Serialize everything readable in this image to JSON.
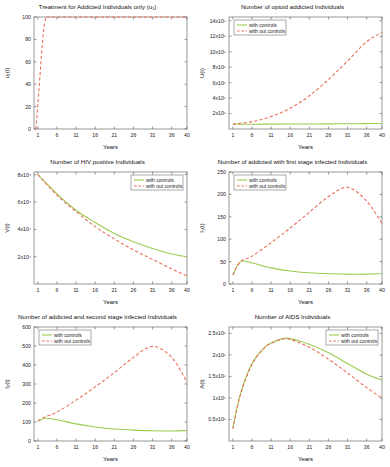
{
  "figure": {
    "panel_count": 6,
    "shared": {
      "xlabel": "Years",
      "xticks": [
        1,
        6,
        11,
        16,
        21,
        26,
        31,
        36,
        40
      ],
      "xlim": [
        0,
        40
      ],
      "legend": [
        "with controls",
        "with out controls"
      ],
      "colors": {
        "with_controls": "#9ccc4f",
        "without_controls": "#e8705a",
        "frame": "#555555",
        "background": "#ffffff"
      }
    }
  },
  "chart_data": [
    {
      "type": "line",
      "title": "Treatment for Addicted Individuals only (u₁)",
      "xlabel": "Years",
      "ylabel": "u₁(t)",
      "xlim": [
        0,
        40
      ],
      "ylim": [
        0,
        100
      ],
      "xticks": [
        1,
        6,
        11,
        16,
        21,
        26,
        31,
        36,
        40
      ],
      "yticks": [
        0,
        20,
        40,
        60,
        80,
        100
      ],
      "grid": false,
      "legend": null,
      "series": [
        {
          "name": "with out controls",
          "style": "dashed",
          "color": "#e8705a",
          "x": [
            0.5,
            1,
            1.5,
            2,
            2.5,
            3,
            3.5,
            4,
            10,
            20,
            30,
            40
          ],
          "values": [
            0,
            22,
            45,
            68,
            88,
            98,
            100,
            100,
            100,
            100,
            100,
            100
          ]
        }
      ]
    },
    {
      "type": "line",
      "title": "Number of opioid addicted Individuals",
      "xlabel": "Years",
      "ylabel": "U(t)",
      "xlim": [
        0,
        40
      ],
      "ylim": [
        0,
        1450000
      ],
      "xticks": [
        1,
        6,
        11,
        16,
        21,
        26,
        31,
        36,
        40
      ],
      "yticks": [
        200000,
        400000,
        600000,
        800000,
        1000000,
        1200000,
        1400000
      ],
      "ytick_labels": [
        "2x10⁵",
        "4x10⁵",
        "6x10⁵",
        "8x10⁵",
        "10x10⁵",
        "12x10⁵",
        "14x10⁵"
      ],
      "grid": false,
      "legend_position": "top-left",
      "series": [
        {
          "name": "with controls",
          "style": "solid",
          "color": "#9ccc4f",
          "x": [
            1,
            6,
            11,
            16,
            21,
            26,
            31,
            36,
            40
          ],
          "values": [
            62000,
            62000,
            63000,
            64000,
            65000,
            66000,
            68000,
            70000,
            72000
          ]
        },
        {
          "name": "with out controls",
          "style": "dashed",
          "color": "#e8705a",
          "x": [
            1,
            6,
            11,
            16,
            21,
            26,
            31,
            36,
            40
          ],
          "values": [
            62000,
            95000,
            160000,
            270000,
            430000,
            640000,
            880000,
            1130000,
            1250000
          ]
        }
      ]
    },
    {
      "type": "line",
      "title": "Number of HIV positive Individuals",
      "xlabel": "Years",
      "ylabel": "V(t)",
      "xlim": [
        0,
        40
      ],
      "ylim": [
        0,
        82000
      ],
      "xticks": [
        1,
        6,
        11,
        16,
        21,
        26,
        31,
        36,
        40
      ],
      "yticks": [
        20000,
        40000,
        60000,
        80000
      ],
      "ytick_labels": [
        "2x10⁴",
        "4x10⁴",
        "6x10⁴",
        "8x10⁴"
      ],
      "grid": false,
      "legend_position": "top-right",
      "series": [
        {
          "name": "with controls",
          "style": "solid",
          "color": "#9ccc4f",
          "x": [
            1,
            6,
            11,
            16,
            21,
            26,
            31,
            36,
            40
          ],
          "values": [
            80000,
            66000,
            54000,
            45000,
            37000,
            31000,
            26000,
            22000,
            20000
          ]
        },
        {
          "name": "with out controls",
          "style": "dashed",
          "color": "#e8705a",
          "x": [
            1,
            6,
            11,
            16,
            21,
            26,
            31,
            36,
            40
          ],
          "values": [
            80000,
            65000,
            53000,
            42000,
            33000,
            25000,
            18000,
            11000,
            6000
          ]
        }
      ]
    },
    {
      "type": "line",
      "title": "Number of addicted with first stage infected Individuals",
      "xlabel": "Years",
      "ylabel": "I₁(t)",
      "xlim": [
        0,
        40
      ],
      "ylim": [
        0,
        250
      ],
      "xticks": [
        1,
        6,
        11,
        16,
        21,
        26,
        31,
        36,
        40
      ],
      "yticks": [
        0,
        50,
        100,
        150,
        200,
        250
      ],
      "grid": false,
      "legend_position": "top-left",
      "series": [
        {
          "name": "with controls",
          "style": "solid",
          "color": "#9ccc4f",
          "x": [
            1,
            3,
            6,
            11,
            16,
            21,
            26,
            31,
            36,
            40
          ],
          "values": [
            20,
            50,
            47,
            36,
            29,
            25,
            23,
            22,
            22,
            23
          ]
        },
        {
          "name": "with out controls",
          "style": "dashed",
          "color": "#e8705a",
          "x": [
            1,
            3,
            6,
            11,
            16,
            21,
            26,
            31,
            36,
            40
          ],
          "values": [
            20,
            50,
            62,
            92,
            125,
            160,
            195,
            216,
            185,
            135
          ]
        }
      ]
    },
    {
      "type": "line",
      "title": "Number of addicted and second stage infected Individuals",
      "xlabel": "Years",
      "ylabel": "I₂(t)",
      "xlim": [
        0,
        40
      ],
      "ylim": [
        0,
        600
      ],
      "xticks": [
        1,
        6,
        11,
        16,
        21,
        26,
        31,
        36,
        40
      ],
      "yticks": [
        0,
        100,
        200,
        300,
        400,
        500,
        600
      ],
      "grid": false,
      "legend_position": "top-left",
      "series": [
        {
          "name": "with controls",
          "style": "solid",
          "color": "#9ccc4f",
          "x": [
            1,
            3,
            6,
            11,
            16,
            21,
            26,
            31,
            36,
            40
          ],
          "values": [
            105,
            120,
            112,
            90,
            74,
            63,
            57,
            54,
            53,
            55
          ]
        },
        {
          "name": "with out controls",
          "style": "dashed",
          "color": "#e8705a",
          "x": [
            1,
            3,
            6,
            11,
            16,
            21,
            26,
            31,
            36,
            40
          ],
          "values": [
            105,
            128,
            152,
            215,
            285,
            360,
            440,
            498,
            440,
            310
          ]
        }
      ]
    },
    {
      "type": "line",
      "title": "Number of AIDS Individuals",
      "xlabel": "Years",
      "ylabel": "A(t)",
      "xlim": [
        0,
        40
      ],
      "ylim": [
        0,
        265000
      ],
      "xticks": [
        1,
        6,
        11,
        16,
        21,
        26,
        31,
        36,
        40
      ],
      "yticks": [
        50000,
        100000,
        150000,
        200000,
        250000
      ],
      "ytick_labels": [
        "0.5x10⁵",
        "1x10⁵",
        "1.5x10⁵",
        "2x10⁵",
        "2.5x10⁵"
      ],
      "grid": false,
      "legend_position": "top-right",
      "series": [
        {
          "name": "with controls",
          "style": "solid",
          "color": "#9ccc4f",
          "x": [
            1,
            3,
            6,
            9,
            11,
            14,
            16,
            21,
            26,
            31,
            36,
            40
          ],
          "values": [
            30000,
            110000,
            180000,
            215000,
            228000,
            238000,
            238000,
            225000,
            205000,
            180000,
            155000,
            142000
          ]
        },
        {
          "name": "with out controls",
          "style": "dashed",
          "color": "#e8705a",
          "x": [
            1,
            3,
            6,
            9,
            11,
            14,
            16,
            21,
            26,
            31,
            36,
            40
          ],
          "values": [
            28000,
            108000,
            178000,
            214000,
            227000,
            237000,
            236000,
            218000,
            190000,
            158000,
            124000,
            100000
          ]
        }
      ]
    }
  ]
}
